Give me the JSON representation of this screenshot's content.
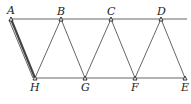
{
  "diagram": {
    "title": "",
    "points": {
      "A": {
        "label": "A",
        "x": 11,
        "y": 19
      },
      "B": {
        "label": "B",
        "x": 61,
        "y": 19
      },
      "C": {
        "label": "C",
        "x": 111,
        "y": 19
      },
      "D": {
        "label": "D",
        "x": 161,
        "y": 19
      },
      "H": {
        "label": "H",
        "x": 35,
        "y": 78
      },
      "G": {
        "label": "G",
        "x": 85,
        "y": 78
      },
      "F": {
        "label": "F",
        "x": 135,
        "y": 78
      },
      "E": {
        "label": "E",
        "x": 185,
        "y": 78
      }
    },
    "edges": [
      [
        "A",
        "B"
      ],
      [
        "B",
        "C"
      ],
      [
        "C",
        "D"
      ],
      [
        "D",
        "end"
      ],
      [
        "H",
        "G"
      ],
      [
        "G",
        "F"
      ],
      [
        "F",
        "E"
      ],
      [
        "A",
        "H"
      ],
      [
        "H",
        "B"
      ],
      [
        "B",
        "G"
      ],
      [
        "G",
        "C"
      ],
      [
        "C",
        "F"
      ],
      [
        "F",
        "D"
      ],
      [
        "D",
        "E"
      ]
    ],
    "highlighted_edge": [
      "A",
      "H"
    ]
  }
}
